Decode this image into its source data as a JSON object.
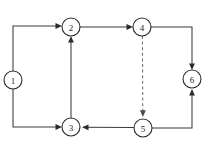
{
  "diagram": {
    "canvas": {
      "width": 211,
      "height": 150,
      "background": "#ffffff"
    },
    "style": {
      "node_fill": "#ffffff",
      "node_stroke": "#2b2b2b",
      "edge_solid_color": "#3a3a3a",
      "edge_dashed_color": "#6f6f6f",
      "label_color": "#1c1c1c",
      "node_radius": 9
    },
    "nodes": [
      {
        "id": "n1",
        "label": "1",
        "cx": 13,
        "cy": 80,
        "r": 9
      },
      {
        "id": "n2",
        "label": "2",
        "cx": 71,
        "cy": 27,
        "r": 9
      },
      {
        "id": "n3",
        "label": "3",
        "cx": 71,
        "cy": 127,
        "r": 9
      },
      {
        "id": "n4",
        "label": "4",
        "cx": 142,
        "cy": 27,
        "r": 9
      },
      {
        "id": "n5",
        "label": "5",
        "cx": 143,
        "cy": 128,
        "r": 9
      },
      {
        "id": "n6",
        "label": "6",
        "cx": 192,
        "cy": 79,
        "r": 9
      }
    ],
    "edges": [
      {
        "id": "e1",
        "from": "1",
        "to": "2",
        "style": "solid",
        "routing": "orthogonal",
        "direction": "up-then-right"
      },
      {
        "id": "e2",
        "from": "1",
        "to": "3",
        "style": "solid",
        "routing": "orthogonal",
        "direction": "down-then-right"
      },
      {
        "id": "e3",
        "from": "2",
        "to": "4",
        "style": "solid",
        "routing": "straight",
        "direction": "right"
      },
      {
        "id": "e4",
        "from": "3",
        "to": "2",
        "style": "solid",
        "routing": "straight",
        "direction": "up"
      },
      {
        "id": "e5",
        "from": "4",
        "to": "6",
        "style": "solid",
        "routing": "orthogonal",
        "direction": "right-then-down"
      },
      {
        "id": "e6",
        "from": "4",
        "to": "5",
        "style": "dashed",
        "routing": "straight",
        "direction": "down"
      },
      {
        "id": "e7",
        "from": "5",
        "to": "3",
        "style": "solid",
        "routing": "straight",
        "direction": "left"
      },
      {
        "id": "e8",
        "from": "5",
        "to": "6",
        "style": "solid",
        "routing": "orthogonal",
        "direction": "right-then-up"
      }
    ]
  }
}
